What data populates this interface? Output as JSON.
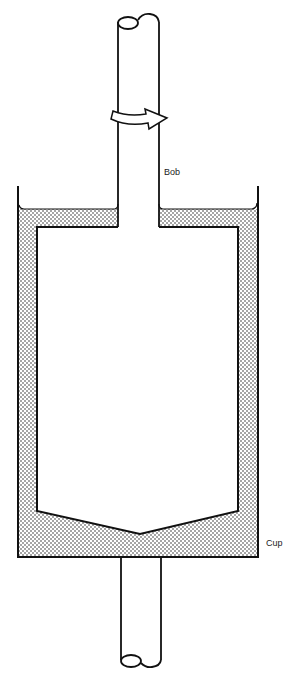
{
  "diagram": {
    "type": "coaxial cylinder (cup and bob) viscometer",
    "labels": {
      "bob": "Bob",
      "cup": "Cup"
    },
    "components": [
      {
        "name": "upper-shaft",
        "description": "rotating shaft attached to bob, broken-end at top"
      },
      {
        "name": "rotation-arrow",
        "description": "curved arrow around shaft indicating rotation"
      },
      {
        "name": "bob",
        "description": "inner cylinder with V-shaped bottom"
      },
      {
        "name": "cup",
        "description": "outer container holding stippled fluid"
      },
      {
        "name": "fluid",
        "description": "stippled sample fluid filling gap between cup and bob"
      },
      {
        "name": "lower-shaft",
        "description": "shaft below cup, broken-end at bottom"
      }
    ],
    "colors": {
      "line": "#111111",
      "background": "#ffffff",
      "stipple": "#333333"
    }
  }
}
